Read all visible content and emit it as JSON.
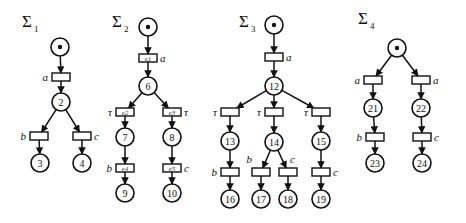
{
  "diagram": {
    "type": "petri-nets",
    "nets": [
      {
        "id": "sigma1",
        "title": "Σ",
        "subscript": "1",
        "title_pos": [
          22,
          27
        ],
        "places": [
          {
            "id": "p1",
            "x": 60,
            "y": 47,
            "label": "",
            "token": true
          },
          {
            "id": "p2",
            "x": 61,
            "y": 102,
            "label": "2"
          },
          {
            "id": "p3",
            "x": 40,
            "y": 163,
            "label": "3"
          },
          {
            "id": "p4",
            "x": 82,
            "y": 163,
            "label": "4"
          }
        ],
        "transitions": [
          {
            "id": "t_a",
            "x": 61,
            "y": 77,
            "label": "a",
            "label_side": "left",
            "event": ""
          },
          {
            "id": "t_b",
            "x": 39,
            "y": 136,
            "label": "b",
            "label_side": "left",
            "event": ""
          },
          {
            "id": "t_c",
            "x": 82,
            "y": 136,
            "label": "c",
            "label_side": "right",
            "event": ""
          }
        ],
        "arcs": [
          [
            "p1",
            "t_a"
          ],
          [
            "t_a",
            "p2"
          ],
          [
            "p2",
            "t_b"
          ],
          [
            "p2",
            "t_c"
          ],
          [
            "t_b",
            "p3"
          ],
          [
            "t_c",
            "p4"
          ]
        ]
      },
      {
        "id": "sigma2",
        "title": "Σ",
        "subscript": "2",
        "title_pos": [
          112,
          27
        ],
        "places": [
          {
            "id": "p5",
            "x": 148,
            "y": 27,
            "label": "",
            "token": true
          },
          {
            "id": "p6",
            "x": 148,
            "y": 86,
            "label": "6"
          },
          {
            "id": "p7",
            "x": 125,
            "y": 137,
            "label": "7"
          },
          {
            "id": "p8",
            "x": 172,
            "y": 137,
            "label": "8"
          },
          {
            "id": "p9",
            "x": 125,
            "y": 193,
            "label": "9"
          },
          {
            "id": "p10",
            "x": 172,
            "y": 193,
            "label": "10"
          }
        ],
        "transitions": [
          {
            "id": "e1",
            "x": 148,
            "y": 58,
            "label": "a",
            "label_side": "right",
            "event": "e1"
          },
          {
            "id": "e2",
            "x": 125,
            "y": 112,
            "label": "τ",
            "label_side": "left",
            "event": "e2"
          },
          {
            "id": "e3",
            "x": 172,
            "y": 112,
            "label": "τ",
            "label_side": "right",
            "event": "e3"
          },
          {
            "id": "e4",
            "x": 125,
            "y": 168,
            "label": "b",
            "label_side": "left",
            "event": "e4"
          },
          {
            "id": "e5",
            "x": 172,
            "y": 168,
            "label": "c",
            "label_side": "right",
            "event": "e5"
          }
        ],
        "arcs": [
          [
            "p5",
            "e1"
          ],
          [
            "e1",
            "p6"
          ],
          [
            "p6",
            "e2"
          ],
          [
            "p6",
            "e3"
          ],
          [
            "e2",
            "p7"
          ],
          [
            "e3",
            "p8"
          ],
          [
            "p7",
            "e4"
          ],
          [
            "p8",
            "e5"
          ],
          [
            "e4",
            "p9"
          ],
          [
            "e5",
            "p10"
          ]
        ]
      },
      {
        "id": "sigma3",
        "title": "Σ",
        "subscript": "3",
        "title_pos": [
          239,
          27
        ],
        "places": [
          {
            "id": "p11",
            "x": 274,
            "y": 25,
            "label": "",
            "token": true
          },
          {
            "id": "p12",
            "x": 274,
            "y": 86,
            "label": "12"
          },
          {
            "id": "p13",
            "x": 230,
            "y": 141,
            "label": "13"
          },
          {
            "id": "p14",
            "x": 274,
            "y": 142,
            "label": "14"
          },
          {
            "id": "p15",
            "x": 321,
            "y": 141,
            "label": "15"
          },
          {
            "id": "p16",
            "x": 230,
            "y": 199,
            "label": "16"
          },
          {
            "id": "p17",
            "x": 261,
            "y": 199,
            "label": "17"
          },
          {
            "id": "p18",
            "x": 288,
            "y": 199,
            "label": "18"
          },
          {
            "id": "p19",
            "x": 321,
            "y": 199,
            "label": "19"
          }
        ],
        "transitions": [
          {
            "id": "t3_a",
            "x": 274,
            "y": 57,
            "label": "a",
            "label_side": "right",
            "event": ""
          },
          {
            "id": "t3_t1",
            "x": 230,
            "y": 112,
            "label": "τ",
            "label_side": "left",
            "event": ""
          },
          {
            "id": "t3_t2",
            "x": 274,
            "y": 112,
            "label": "τ",
            "label_side": "left",
            "event": ""
          },
          {
            "id": "t3_t3",
            "x": 321,
            "y": 112,
            "label": "τ",
            "label_side": "left",
            "event": ""
          },
          {
            "id": "t3_b1",
            "x": 230,
            "y": 172,
            "label": "b",
            "label_side": "left",
            "event": ""
          },
          {
            "id": "t3_b2",
            "x": 261,
            "y": 172,
            "label": "b",
            "label_side": "top-left",
            "event": ""
          },
          {
            "id": "t3_c1",
            "x": 288,
            "y": 172,
            "label": "c",
            "label_side": "top-right",
            "event": ""
          },
          {
            "id": "t3_c2",
            "x": 321,
            "y": 172,
            "label": "c",
            "label_side": "right",
            "event": ""
          }
        ],
        "arcs": [
          [
            "p11",
            "t3_a"
          ],
          [
            "t3_a",
            "p12"
          ],
          [
            "p12",
            "t3_t1"
          ],
          [
            "p12",
            "t3_t2"
          ],
          [
            "p12",
            "t3_t3"
          ],
          [
            "t3_t1",
            "p13"
          ],
          [
            "t3_t2",
            "p14"
          ],
          [
            "t3_t3",
            "p15"
          ],
          [
            "p13",
            "t3_b1"
          ],
          [
            "p14",
            "t3_b2"
          ],
          [
            "p14",
            "t3_c1"
          ],
          [
            "p15",
            "t3_c2"
          ],
          [
            "t3_b1",
            "p16"
          ],
          [
            "t3_b2",
            "p17"
          ],
          [
            "t3_c1",
            "p18"
          ],
          [
            "t3_c2",
            "p19"
          ]
        ]
      },
      {
        "id": "sigma4",
        "title": "Σ",
        "subscript": "4",
        "title_pos": [
          358,
          24
        ],
        "places": [
          {
            "id": "p20",
            "x": 397,
            "y": 48,
            "label": "",
            "token": true
          },
          {
            "id": "p21",
            "x": 373,
            "y": 108,
            "label": "21"
          },
          {
            "id": "p22",
            "x": 421,
            "y": 108,
            "label": "22"
          },
          {
            "id": "p23",
            "x": 375,
            "y": 163,
            "label": "23"
          },
          {
            "id": "p24",
            "x": 422,
            "y": 163,
            "label": "24"
          }
        ],
        "transitions": [
          {
            "id": "t4_a1",
            "x": 373,
            "y": 80,
            "label": "a",
            "label_side": "left",
            "event": ""
          },
          {
            "id": "t4_a2",
            "x": 421,
            "y": 80,
            "label": "a",
            "label_side": "right",
            "event": ""
          },
          {
            "id": "t4_b",
            "x": 375,
            "y": 137,
            "label": "b",
            "label_side": "left",
            "event": ""
          },
          {
            "id": "t4_c",
            "x": 422,
            "y": 137,
            "label": "c",
            "label_side": "right",
            "event": ""
          }
        ],
        "arcs": [
          [
            "p20",
            "t4_a1"
          ],
          [
            "p20",
            "t4_a2"
          ],
          [
            "t4_a1",
            "p21"
          ],
          [
            "t4_a2",
            "p22"
          ],
          [
            "p21",
            "t4_b"
          ],
          [
            "p22",
            "t4_c"
          ],
          [
            "t4_b",
            "p23"
          ],
          [
            "t4_c",
            "p24"
          ]
        ]
      }
    ]
  },
  "style": {
    "stroke": "#111111",
    "background": "#ffffff"
  }
}
